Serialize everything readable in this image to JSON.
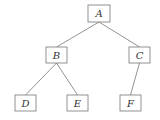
{
  "diagram": {
    "type": "tree",
    "colors": {
      "stroke": "#777777",
      "fill": "#ffffff",
      "text": "#333333"
    },
    "nodes": [
      {
        "id": "A",
        "label": "A",
        "x": 88,
        "y": 5,
        "w": 22,
        "h": 17
      },
      {
        "id": "B",
        "label": "B",
        "x": 46,
        "y": 47,
        "w": 21,
        "h": 16
      },
      {
        "id": "C",
        "label": "C",
        "x": 129,
        "y": 47,
        "w": 21,
        "h": 16
      },
      {
        "id": "D",
        "label": "D",
        "x": 15,
        "y": 95,
        "w": 21,
        "h": 16
      },
      {
        "id": "E",
        "label": "E",
        "x": 67,
        "y": 95,
        "w": 21,
        "h": 16
      },
      {
        "id": "F",
        "label": "F",
        "x": 120,
        "y": 95,
        "w": 21,
        "h": 16
      }
    ],
    "edges": [
      {
        "from": "A",
        "to": "B"
      },
      {
        "from": "A",
        "to": "C"
      },
      {
        "from": "B",
        "to": "D"
      },
      {
        "from": "B",
        "to": "E"
      },
      {
        "from": "C",
        "to": "F"
      }
    ]
  }
}
